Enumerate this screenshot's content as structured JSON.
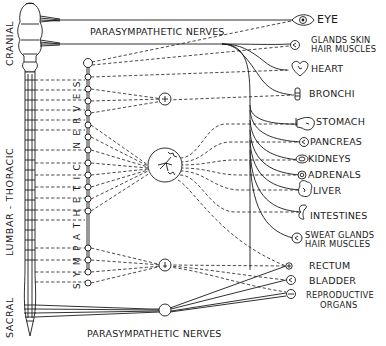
{
  "diagram": {
    "colors": {
      "ink": "#1a1a1a",
      "background": "#ffffff"
    },
    "spinal_regions": [
      {
        "id": "cranial",
        "label": "CRANIAL"
      },
      {
        "id": "lumbar_thoracic",
        "label": "LUMBAR - THORACIC"
      },
      {
        "id": "sacral",
        "label": "SACRAL"
      }
    ],
    "chain_label": "SYMPATHETIC NERVES",
    "nerve_labels": {
      "top": "PARASYMPATHETIC NERVES",
      "bottom": "PARASYMPATHETIC NERVES"
    },
    "organs": [
      {
        "id": "eye",
        "label": "EYE",
        "icon": "eye-icon"
      },
      {
        "id": "glands_skin",
        "label": "GLANDS SKIN",
        "label2": "HAIR MUSCLES",
        "icon": "ganglion-icon"
      },
      {
        "id": "heart",
        "label": "HEART",
        "icon": "heart-icon"
      },
      {
        "id": "bronchi",
        "label": "BRONCHI",
        "icon": "bronchi-icon"
      },
      {
        "id": "stomach",
        "label": "STOMACH",
        "icon": "stomach-icon"
      },
      {
        "id": "pancreas",
        "label": "PANCREAS",
        "icon": "pancreas-icon"
      },
      {
        "id": "kidneys",
        "label": "KIDNEYS",
        "icon": "kidneys-icon"
      },
      {
        "id": "adrenals",
        "label": "ADRENALS",
        "icon": "adrenals-icon"
      },
      {
        "id": "liver",
        "label": "LIVER",
        "icon": "liver-icon"
      },
      {
        "id": "intestines",
        "label": "INTESTINES",
        "icon": "intestines-icon"
      },
      {
        "id": "sweat_glands",
        "label": "SWEAT GLANDS",
        "label2": "HAIR MUSCLES",
        "icon": "ganglion-icon"
      },
      {
        "id": "rectum",
        "label": "RECTUM",
        "icon": "rectum-icon"
      },
      {
        "id": "bladder",
        "label": "BLADDER",
        "icon": "bladder-icon"
      },
      {
        "id": "reproductive",
        "label": "REPRODUCTIVE",
        "label2": "ORGANS",
        "icon": "reproductive-icon"
      }
    ]
  }
}
